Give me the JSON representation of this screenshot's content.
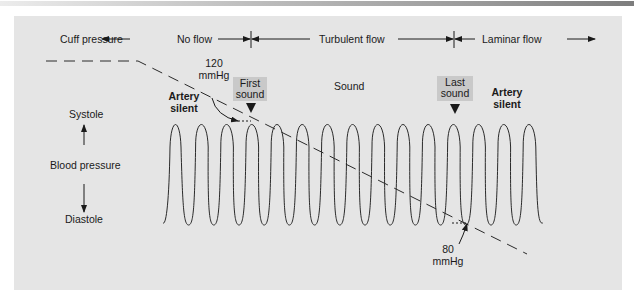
{
  "diagram": {
    "header": {
      "cuff_pressure": "Cuff pressure",
      "no_flow": "No flow",
      "turbulent_flow": "Turbulent flow",
      "laminar_flow": "Laminar flow"
    },
    "labels": {
      "systolic_value": "120",
      "systolic_unit": "mmHg",
      "first_sound_line1": "First",
      "first_sound_line2": "sound",
      "sound": "Sound",
      "last_sound_line1": "Last",
      "last_sound_line2": "sound",
      "artery_silent_left_line1": "Artery",
      "artery_silent_left_line2": "silent",
      "artery_silent_right_line1": "Artery",
      "artery_silent_right_line2": "silent",
      "systole": "Systole",
      "blood_pressure": "Blood pressure",
      "diastole": "Diastole",
      "diastolic_value": "80",
      "diastolic_unit": "mmHg"
    },
    "colors": {
      "panel_bg": "#e5e5e5",
      "sound_box": "#c9c9c9",
      "line": "#2a2a2a"
    },
    "wave": {
      "cycles": 14,
      "peak_y": 117,
      "trough_y": 225,
      "start_x": 163,
      "period_px": 25.2
    }
  }
}
